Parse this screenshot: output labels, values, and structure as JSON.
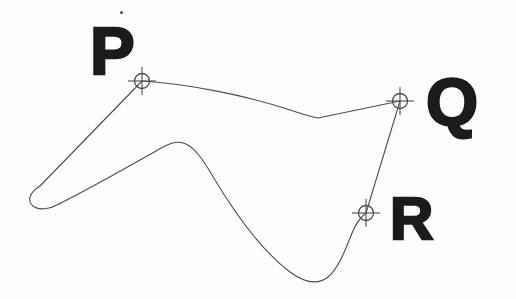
{
  "figure": {
    "kind": "scanned-geometry-diagram",
    "background_color": "#fdfdfb",
    "ink_color": "#4d4d4d",
    "label_color": "#1b1b1b",
    "curve_stroke_width": 1.1,
    "marker_stroke_width": 0.9,
    "labels": [
      {
        "id": "P",
        "text": "P",
        "x": 90,
        "y": 17
      },
      {
        "id": "Q",
        "text": "Q",
        "x": 426,
        "y": 68
      },
      {
        "id": "R",
        "text": "R",
        "x": 390,
        "y": 189
      }
    ],
    "markers": [
      {
        "id": "marker-P",
        "label": "P",
        "cx": 142,
        "cy": 81,
        "radius": 7.5,
        "arm": 14
      },
      {
        "id": "marker-Q",
        "label": "Q",
        "cx": 400,
        "cy": 101,
        "radius": 7.5,
        "arm": 14
      },
      {
        "id": "marker-R",
        "label": "R",
        "cx": 366,
        "cy": 213,
        "radius": 7.5,
        "arm": 14
      }
    ],
    "speck": {
      "cx": 121,
      "cy": 12,
      "r": 1.4
    },
    "paths": {
      "upper_boundary": "M 142 81 C 190 84 248 96 290 110 C 302 114 312 117 318 118 L 400 101",
      "left_spur": "M 142 81 L 40 186 C 29 193 27 201 33 206 C 39 211 50 209 59 204",
      "lower_boundary": "M 59 204 C 100 183 140 160 163 147 C 172 142 180 141 186 144 C 196 149 203 160 212 175 C 228 202 258 248 290 272 C 305 283 318 285 328 277 C 338 269 345 251 352 233 C 357 221 362 216 366 213",
      "right_chord": "M 400 101 L 366 213"
    }
  }
}
